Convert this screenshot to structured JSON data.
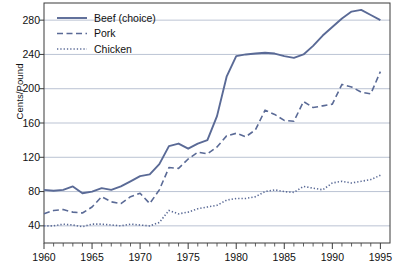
{
  "chart_data": {
    "type": "line",
    "title": "",
    "xlabel": "",
    "ylabel": "Cents/Pound",
    "xlim": [
      1960,
      1996
    ],
    "ylim": [
      20,
      300
    ],
    "yticks": [
      40,
      80,
      120,
      160,
      200,
      240,
      280
    ],
    "xticks": [
      1960,
      1965,
      1970,
      1975,
      1980,
      1985,
      1990,
      1995
    ],
    "x_minor_tick_step": 1,
    "grid": "horizontal",
    "legend_position": "top-left inside plot",
    "x": [
      1960,
      1961,
      1962,
      1963,
      1964,
      1965,
      1966,
      1967,
      1968,
      1969,
      1970,
      1971,
      1972,
      1973,
      1974,
      1975,
      1976,
      1977,
      1978,
      1979,
      1980,
      1981,
      1982,
      1983,
      1984,
      1985,
      1986,
      1987,
      1988,
      1989,
      1990,
      1991,
      1992,
      1993,
      1994,
      1995
    ],
    "series": [
      {
        "name": "Beef (choice)",
        "style": "solid",
        "color": "#5a6a96",
        "values": [
          82,
          81,
          82,
          86,
          78,
          80,
          84,
          82,
          86,
          92,
          98,
          100,
          112,
          133,
          136,
          130,
          136,
          140,
          168,
          214,
          238,
          240,
          241,
          242,
          241,
          238,
          236,
          240,
          250,
          262,
          272,
          282,
          290,
          292,
          286,
          280
        ]
      },
      {
        "name": "Pork",
        "style": "dashed",
        "color": "#5a6a96",
        "values": [
          54,
          58,
          59,
          56,
          55,
          62,
          74,
          68,
          66,
          74,
          78,
          66,
          82,
          108,
          107,
          118,
          126,
          124,
          132,
          145,
          148,
          144,
          152,
          175,
          170,
          163,
          162,
          185,
          178,
          180,
          182,
          205,
          202,
          196,
          194,
          220
        ]
      },
      {
        "name": "Chicken",
        "style": "dotted",
        "color": "#5a6a96",
        "values": [
          40,
          40,
          42,
          41,
          39,
          42,
          42,
          41,
          40,
          42,
          41,
          40,
          44,
          58,
          54,
          56,
          60,
          62,
          64,
          70,
          72,
          72,
          74,
          80,
          82,
          80,
          79,
          86,
          84,
          82,
          90,
          92,
          90,
          92,
          94,
          99
        ]
      }
    ],
    "legend": [
      {
        "label": "Beef (choice)",
        "style": "solid"
      },
      {
        "label": "Pork",
        "style": "dashed"
      },
      {
        "label": "Chicken",
        "style": "dotted"
      }
    ],
    "colors": {
      "line": "#5a6a96",
      "grid": "#aab4c8",
      "axis": "#3a3a3a",
      "background": "#ffffff",
      "text": "#111111"
    }
  }
}
